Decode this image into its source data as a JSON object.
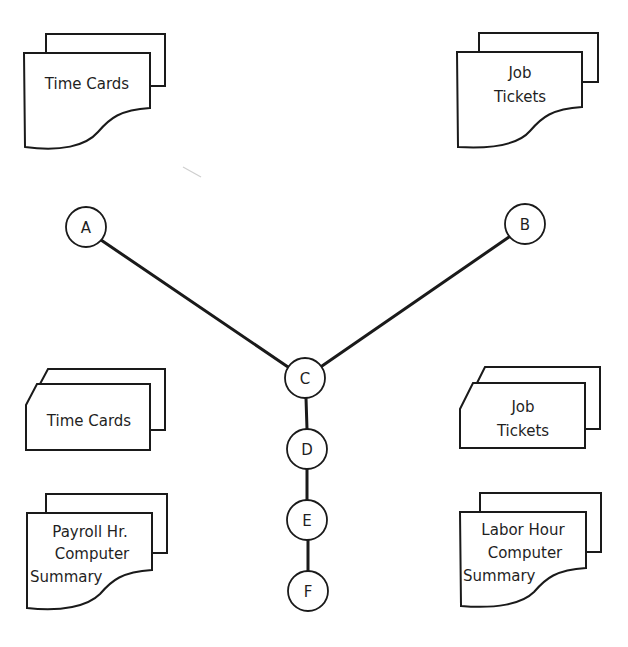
{
  "diagram": {
    "type": "flow-network",
    "nodes": [
      {
        "id": "A",
        "label": "A",
        "cx": 86,
        "cy": 227
      },
      {
        "id": "B",
        "label": "B",
        "cx": 525,
        "cy": 224
      },
      {
        "id": "C",
        "label": "C",
        "cx": 305,
        "cy": 378
      },
      {
        "id": "D",
        "label": "D",
        "cx": 307,
        "cy": 449
      },
      {
        "id": "E",
        "label": "E",
        "cx": 307,
        "cy": 520
      },
      {
        "id": "F",
        "label": "F",
        "cx": 307,
        "cy": 591
      }
    ],
    "edges": [
      {
        "from": "A",
        "to": "C"
      },
      {
        "from": "B",
        "to": "C"
      },
      {
        "from": "C",
        "to": "D"
      },
      {
        "from": "D",
        "to": "E"
      },
      {
        "from": "E",
        "to": "F"
      }
    ],
    "documents": {
      "top_left": {
        "shape": "document-stack",
        "lines": [
          "Time Cards"
        ]
      },
      "top_right": {
        "shape": "document-stack",
        "lines": [
          "Job",
          "Tickets"
        ]
      },
      "mid_left": {
        "shape": "punched-card-stack",
        "lines": [
          "Time Cards"
        ]
      },
      "mid_right": {
        "shape": "punched-card-stack",
        "lines": [
          "Job",
          "Tickets"
        ]
      },
      "bottom_left": {
        "shape": "document-stack",
        "lines": [
          "Payroll Hr.",
          "Computer",
          "Summary"
        ]
      },
      "bottom_right": {
        "shape": "document-stack",
        "lines": [
          "Labor Hour",
          "Computer",
          "Summary"
        ]
      }
    },
    "colors": {
      "stroke": "#1a1a1a",
      "background": "#ffffff"
    }
  }
}
